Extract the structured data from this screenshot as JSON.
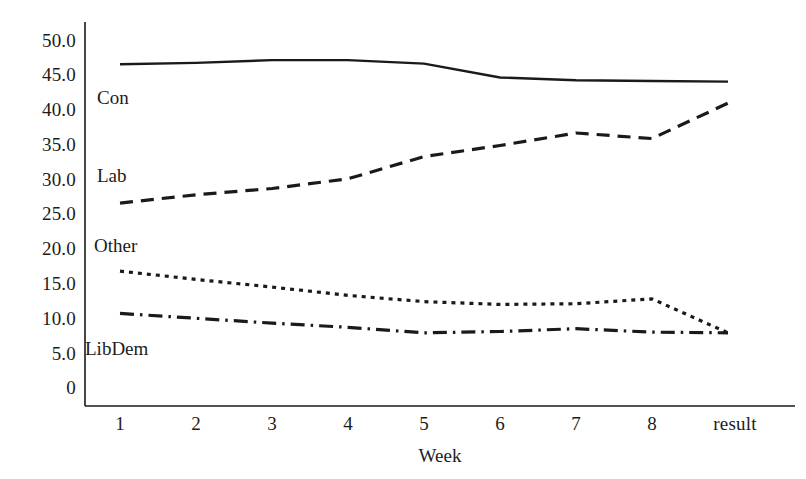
{
  "chart_data": {
    "type": "line",
    "title": "",
    "xlabel": "Week",
    "ylabel": "",
    "categories": [
      "1",
      "2",
      "3",
      "4",
      "5",
      "6",
      "7",
      "8",
      "result"
    ],
    "x_tick_labels": [
      "1",
      "2",
      "3",
      "4",
      "5",
      "6",
      "7",
      "8",
      "result"
    ],
    "y_tick_labels": [
      "50.0",
      "45.0",
      "40.0",
      "35.0",
      "30.0",
      "25.0",
      "20.0",
      "15.0",
      "10.0",
      "5.0",
      "0"
    ],
    "y_tick_values": [
      50,
      45,
      40,
      35,
      30,
      25,
      20,
      15,
      10,
      5,
      0
    ],
    "ylim": [
      0,
      52
    ],
    "grid": false,
    "legend_position": "inline-left",
    "line_color": "#1a1a1a",
    "series": [
      {
        "name": "Con",
        "label": "Con",
        "style": "solid",
        "values": [
          46.5,
          46.7,
          47.1,
          47.1,
          46.6,
          44.6,
          44.2,
          44.1,
          44.0
        ]
      },
      {
        "name": "Lab",
        "label": "Lab",
        "style": "dashed",
        "values": [
          26.5,
          27.7,
          28.6,
          30.0,
          33.2,
          34.8,
          36.6,
          35.8,
          40.9
        ]
      },
      {
        "name": "Other",
        "label": "Other",
        "style": "dotted",
        "values": [
          16.7,
          15.5,
          14.4,
          13.2,
          12.3,
          11.9,
          12.0,
          12.7,
          7.8
        ]
      },
      {
        "name": "LibDem",
        "label": "LibDem",
        "style": "dashdot",
        "values": [
          10.6,
          9.9,
          9.2,
          8.6,
          7.8,
          8.0,
          8.4,
          7.9,
          7.8
        ]
      }
    ],
    "series_label_positions": [
      {
        "name": "Con",
        "x": 97,
        "y": 97
      },
      {
        "name": "Lab",
        "x": 97,
        "y": 178
      },
      {
        "name": "Other",
        "x": 94,
        "y": 250
      },
      {
        "name": "LibDem",
        "x": 85,
        "y": 352
      }
    ]
  }
}
